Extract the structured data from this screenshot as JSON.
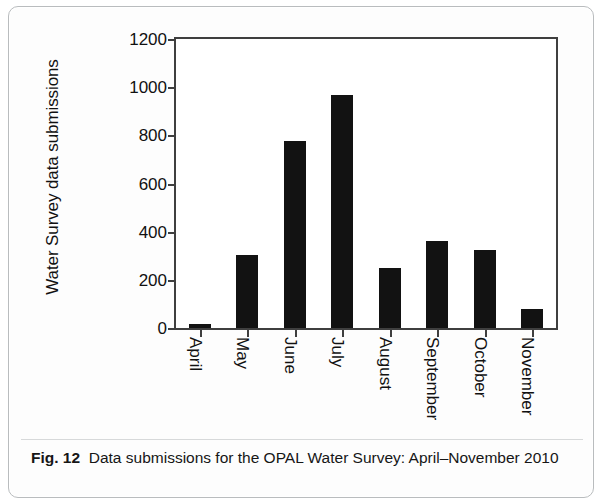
{
  "figure": {
    "caption_label": "Fig. 12",
    "caption_text": "Data submissions for the OPAL Water Survey: April–November 2010"
  },
  "chart_data": {
    "type": "bar",
    "title": "",
    "xlabel": "",
    "ylabel": "Water Survey data submissions",
    "categories": [
      "April",
      "May",
      "June",
      "July",
      "August",
      "September",
      "October",
      "November"
    ],
    "values": [
      15,
      303,
      777,
      968,
      249,
      361,
      324,
      80
    ],
    "ylim": [
      0,
      1200
    ],
    "yticks": [
      0,
      200,
      400,
      600,
      800,
      1000,
      1200
    ],
    "ytick_labels": [
      "0",
      "200",
      "400",
      "600",
      "800",
      "1000",
      "1200"
    ],
    "grid": false,
    "legend": false,
    "bar_color": "#121212",
    "axis_color": "#3f3f3f",
    "series": [
      {
        "name": "Water Survey data submissions",
        "values": [
          15,
          303,
          777,
          968,
          249,
          361,
          324,
          80
        ]
      }
    ]
  }
}
